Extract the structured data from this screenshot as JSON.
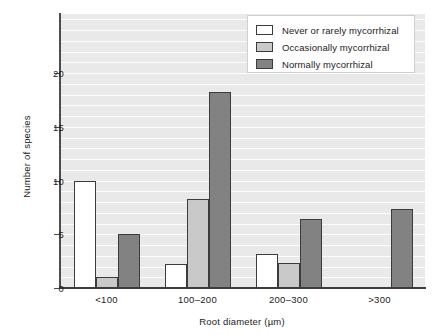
{
  "chart_data": {
    "type": "bar",
    "title": "",
    "xlabel": "Root diameter (µm)",
    "ylabel": "Number of species",
    "categories": [
      "<100",
      "100–200",
      "200–300",
      ">300"
    ],
    "series": [
      {
        "name": "Never or rarely mycorrhizal",
        "color": "#ffffff",
        "values": [
          10,
          2.2,
          3.2,
          0
        ]
      },
      {
        "name": "Occasionally mycorrhizal",
        "color": "#c9c9c9",
        "values": [
          1,
          8.3,
          2.3,
          0
        ]
      },
      {
        "name": "Normally mycorrhizal",
        "color": "#828282",
        "values": [
          5,
          18.2,
          6.4,
          7.4
        ]
      }
    ],
    "ylim": [
      0,
      25.5
    ],
    "yticks": [
      0,
      5,
      10,
      15,
      20
    ],
    "ytick_labels": [
      "0",
      "5",
      "10",
      "15",
      "20"
    ],
    "gridlines": [
      1,
      2,
      3,
      4,
      5,
      6,
      7,
      8,
      9,
      10,
      11,
      12,
      13,
      14,
      15,
      16,
      17,
      18,
      19,
      20,
      21,
      22,
      23,
      24,
      25
    ],
    "grid": true,
    "grid_color": "#fdfdfd",
    "plot_background": "#e9e9e9",
    "legend_position": "top-right",
    "bar_edge_color": "#3c3c3c"
  }
}
